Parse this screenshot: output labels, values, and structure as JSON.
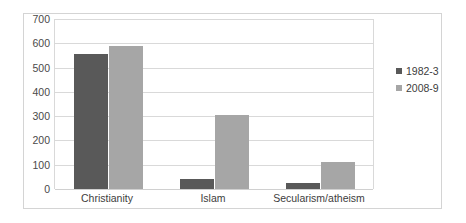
{
  "chart_data": {
    "type": "bar",
    "title": "",
    "subtitle": "",
    "xlabel": "",
    "ylabel": "",
    "categories": [
      "Christianity",
      "Islam",
      "Secularism/atheism"
    ],
    "series": [
      {
        "name": "1982-3",
        "color": "#595959",
        "values": [
          555,
          40,
          25
        ]
      },
      {
        "name": "2008-9",
        "color": "#a6a6a6",
        "values": [
          590,
          305,
          112
        ]
      }
    ],
    "ylim": [
      0,
      700
    ],
    "ytick_step": 100,
    "ytick_labels": [
      "700",
      "600",
      "500",
      "400",
      "300",
      "200",
      "100",
      "0"
    ],
    "ytick_values": [
      700,
      600,
      500,
      400,
      300,
      200,
      100,
      0
    ],
    "grid": true,
    "legend_position": "right",
    "legend_entries": [
      "1982-3",
      "2008-9"
    ]
  },
  "colors": {
    "series_a": "#595959",
    "series_b": "#a6a6a6",
    "gridline": "#d9d9d9",
    "frame_border": "#d4d4d4",
    "background": "#ffffff",
    "tick_text": "#4a4a4a"
  }
}
